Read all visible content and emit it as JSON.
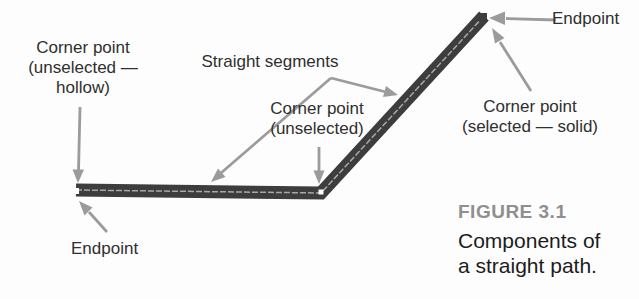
{
  "figure_caption": {
    "label": "FIGURE 3.1",
    "lines": [
      "Components of",
      "a straight path."
    ]
  },
  "callouts": {
    "corner_hollow": {
      "lines": [
        "Corner point",
        "(unselected —",
        "hollow)"
      ]
    },
    "straight_segments": {
      "text": "Straight segments"
    },
    "corner_unselected": {
      "lines": [
        "Corner point",
        "(unselected)"
      ]
    },
    "endpoint_top": {
      "text": "Endpoint"
    },
    "corner_selected": {
      "lines": [
        "Corner point",
        "(selected — solid)"
      ]
    },
    "endpoint_bottom": {
      "text": "Endpoint"
    }
  },
  "colors": {
    "background": "#fdfdfd",
    "path_stroke": "#3d3d3d",
    "path_centerline": "#a8a8a8",
    "arrow": "#9b9b9b",
    "label_text": "#2f2f2f",
    "figure_label": "#8f8f8f",
    "caption_text": "#1c1c1c"
  },
  "diagram": {
    "path_points": [
      [
        76,
        190
      ],
      [
        321,
        193
      ],
      [
        484,
        16
      ]
    ],
    "anchors": [
      {
        "type": "endpoint-hollow",
        "x": 76,
        "y": 191
      },
      {
        "type": "corner-hollow",
        "x": 321,
        "y": 192
      },
      {
        "type": "endpoint-selected-solid",
        "x": 483,
        "y": 17
      }
    ]
  }
}
